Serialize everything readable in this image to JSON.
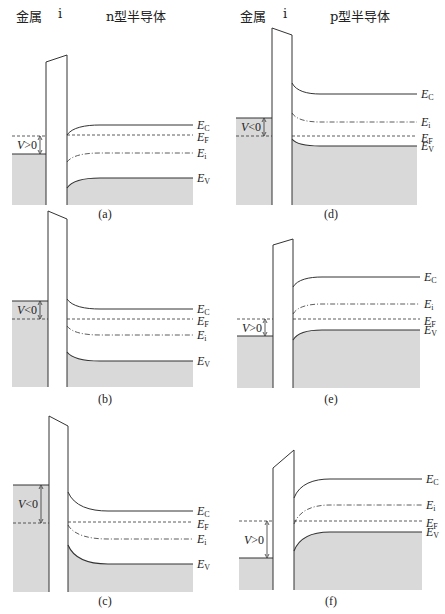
{
  "headers": {
    "left": {
      "metal": "金属",
      "insulator": "i",
      "semiconductor": "n型半导体"
    },
    "right": {
      "metal": "金属",
      "insulator": "i",
      "semiconductor": "p型半导体"
    }
  },
  "colors": {
    "line": "#333333",
    "fill": "#d9d9d9",
    "background": "#ffffff"
  },
  "labels": {
    "Ec": [
      "E",
      "C"
    ],
    "EF": [
      "E",
      "F"
    ],
    "Ei": [
      "E",
      "i"
    ],
    "EV": [
      "E",
      "V"
    ]
  },
  "panels": [
    {
      "id": "a",
      "caption": "(a)",
      "type": "n",
      "voltage": "V>0",
      "metal": {
        "x0": 12,
        "x1": 46,
        "top": 154,
        "bottom": 205,
        "ef_metal": 136
      },
      "insulator": {
        "x0": 46,
        "x1": 67,
        "top_left": 62,
        "top_right": 55,
        "bottom": 205
      },
      "semi": {
        "x0": 67,
        "x1": 193,
        "bend_end": 100,
        "Ec": [
          135,
          125
        ],
        "EF": [
          135,
          135
        ],
        "Ei": [
          162,
          153
        ],
        "EV": [
          188,
          178
        ]
      },
      "arrow": {
        "x": 40,
        "y0": 136,
        "y1": 154
      },
      "caption_pos": [
        105,
        218
      ]
    },
    {
      "id": "b",
      "caption": "(b)",
      "type": "n",
      "voltage": "V<0",
      "metal": {
        "x0": 12,
        "x1": 48,
        "top": 301,
        "bottom": 387,
        "ef_metal": 319
      },
      "insulator": {
        "x0": 48,
        "x1": 67,
        "top_left": 211,
        "top_right": 219,
        "bottom": 387
      },
      "semi": {
        "x0": 67,
        "x1": 193,
        "bend_end": 100,
        "Ec": [
          299,
          309
        ],
        "EF": [
          319,
          319
        ],
        "Ei": [
          326,
          335
        ],
        "EV": [
          352,
          361
        ]
      },
      "arrow": {
        "x": 40,
        "y0": 301,
        "y1": 319
      },
      "caption_pos": [
        105,
        403
      ]
    },
    {
      "id": "c",
      "caption": "(c)",
      "type": "n",
      "voltage": "V<0",
      "metal": {
        "x0": 13,
        "x1": 49,
        "top": 485,
        "bottom": 592,
        "ef_metal": 523
      },
      "insulator": {
        "x0": 49,
        "x1": 68,
        "top_left": 416,
        "top_right": 426,
        "bottom": 592
      },
      "semi": {
        "x0": 68,
        "x1": 193,
        "bend_end": 108,
        "Ec": [
          492,
          511
        ],
        "EF": [
          522,
          522
        ],
        "Ei": [
          525,
          539
        ],
        "EV": [
          545,
          564
        ]
      },
      "arrow": {
        "x": 41,
        "y0": 485,
        "y1": 523
      },
      "caption_pos": [
        105,
        605
      ]
    },
    {
      "id": "d",
      "caption": "(d)",
      "type": "p",
      "voltage": "V<0",
      "metal": {
        "x0": 236,
        "x1": 272,
        "top": 118,
        "bottom": 205,
        "ef_metal": 136
      },
      "insulator": {
        "x0": 272,
        "x1": 292,
        "top_left": 28,
        "top_right": 35,
        "bottom": 205
      },
      "semi": {
        "x0": 292,
        "x1": 417,
        "bend_end": 320,
        "Ec": [
          83,
          94
        ],
        "EF": [
          136,
          136
        ],
        "Ei": [
          113,
          122
        ],
        "EV": [
          139,
          146
        ]
      },
      "arrow": {
        "x": 264,
        "y0": 118,
        "y1": 136
      },
      "caption_pos": [
        331,
        218
      ]
    },
    {
      "id": "e",
      "caption": "(e)",
      "type": "p",
      "voltage": "V>0",
      "metal": {
        "x0": 237,
        "x1": 273,
        "top": 336,
        "bottom": 388,
        "ef_metal": 319
      },
      "insulator": {
        "x0": 273,
        "x1": 293,
        "top_left": 245,
        "top_right": 239,
        "bottom": 388
      },
      "semi": {
        "x0": 293,
        "x1": 420,
        "bend_end": 322,
        "Ec": [
          287,
          277
        ],
        "EF": [
          319,
          319
        ],
        "Ei": [
          314,
          304
        ],
        "EV": [
          340,
          330
        ]
      },
      "arrow": {
        "x": 265,
        "y0": 319,
        "y1": 336
      },
      "caption_pos": [
        331,
        403
      ]
    },
    {
      "id": "f",
      "caption": "(f)",
      "type": "p",
      "voltage": "V>0",
      "metal": {
        "x0": 239,
        "x1": 273,
        "top": 558,
        "bottom": 590,
        "ef_metal": 521
      },
      "insulator": {
        "x0": 273,
        "x1": 294,
        "top_left": 468,
        "top_right": 450,
        "bottom": 590
      },
      "semi": {
        "x0": 294,
        "x1": 422,
        "bend_end": 330,
        "Ec": [
          498,
          479
        ],
        "EF": [
          521,
          521
        ],
        "Ei": [
          524,
          505
        ],
        "EV": [
          551,
          532
        ]
      },
      "arrow": {
        "x": 267,
        "y0": 521,
        "y1": 558
      },
      "caption_pos": [
        331,
        605
      ]
    }
  ]
}
